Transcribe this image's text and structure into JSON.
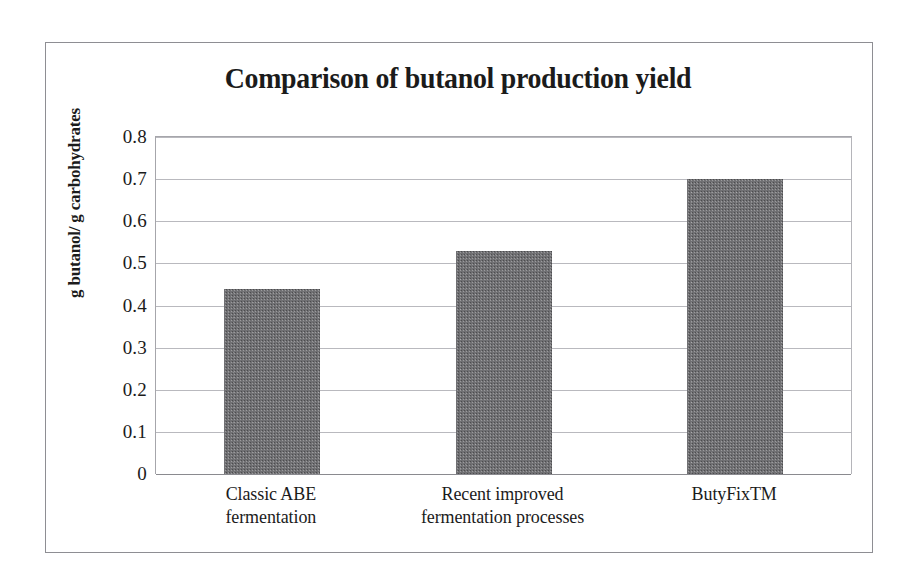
{
  "figure": {
    "title": "Comparison of butanol production yield",
    "y_axis_title": "g butanol/ g carbohydrates",
    "frame_color": "#8e8e93",
    "bar_color": "#707073",
    "text_color": "#1b1b1b"
  },
  "chart_data": {
    "type": "bar",
    "title": "Comparison of butanol production yield",
    "categories": [
      "Classic ABE fermentation",
      "Recent improved fermentation processes",
      "ButyFixTM"
    ],
    "category_lines": [
      [
        "Classic ABE",
        "fermentation"
      ],
      [
        "Recent improved",
        "fermentation processes"
      ],
      [
        "ButyFixTM",
        ""
      ]
    ],
    "values": [
      0.44,
      0.53,
      0.7
    ],
    "xlabel": "",
    "ylabel": "g butanol/ g carbohydrates",
    "ylim": [
      0,
      0.8
    ],
    "yticks": [
      "0.8",
      "0.7",
      "0.6",
      "0.5",
      "0.4",
      "0.3",
      "0.2",
      "0.1",
      "0"
    ],
    "ytick_values": [
      0.8,
      0.7,
      0.6,
      0.5,
      0.4,
      0.3,
      0.2,
      0.1,
      0
    ],
    "grid": true,
    "legend": false
  }
}
